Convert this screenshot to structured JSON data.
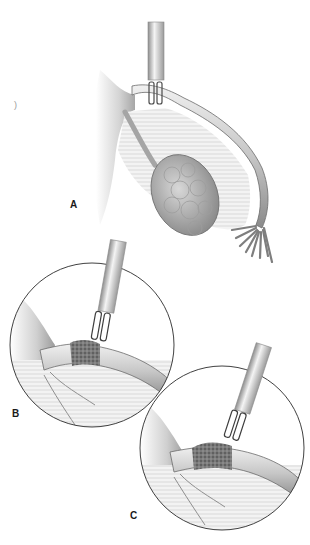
{
  "figure": {
    "panels": [
      {
        "id": "A",
        "label": "A",
        "description": "Overview: bipolar forceps grasping fallopian tube near uterine cornu; ovary, mesosalpinx and fimbriae visible"
      },
      {
        "id": "B",
        "label": "B",
        "description": "Magnified circle: forceps applied to tube, first coagulated segment"
      },
      {
        "id": "C",
        "label": "C",
        "description": "Magnified circle: forceps advanced distally, longer coagulated segment"
      }
    ],
    "stray_mark": ")",
    "colors": {
      "outline": "#2b2b2b",
      "tissue_light": "#e4e4e4",
      "tissue_mid": "#bdbdbd",
      "tissue_dark": "#7a7a7a",
      "coagulated": "#5a5a5a",
      "instrument": "#dcdcdc"
    }
  }
}
